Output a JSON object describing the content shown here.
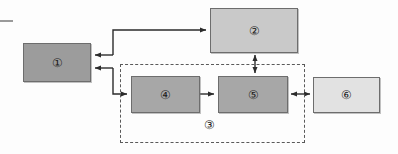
{
  "diagram": {
    "background_color": "#fdfdfd",
    "nodes": [
      {
        "id": "node-1",
        "label": "①",
        "number": 1,
        "x": 23,
        "y": 43,
        "w": 68,
        "h": 39,
        "fill": "#9c9c9c",
        "stroke": "#6d6d6d"
      },
      {
        "id": "node-2",
        "label": "②",
        "number": 2,
        "x": 210,
        "y": 8,
        "w": 88,
        "h": 45,
        "fill": "#c9c9c9",
        "stroke": "#6d6d6d"
      },
      {
        "id": "node-4",
        "label": "④",
        "number": 4,
        "x": 131,
        "y": 76,
        "w": 69,
        "h": 37,
        "fill": "#a7a7a7",
        "stroke": "#6d6d6d"
      },
      {
        "id": "node-5",
        "label": "⑤",
        "number": 5,
        "x": 218,
        "y": 76,
        "w": 70,
        "h": 37,
        "fill": "#a7a7a7",
        "stroke": "#6d6d6d"
      },
      {
        "id": "node-6",
        "label": "⑥",
        "number": 6,
        "x": 313,
        "y": 77,
        "w": 67,
        "h": 36,
        "fill": "#e2e2e2",
        "stroke": "#6d6d6d"
      }
    ],
    "group": {
      "id": "group-3",
      "label": "③",
      "number": 3,
      "x": 120,
      "y": 64,
      "w": 185,
      "h": 79,
      "stroke": "#5a5a5a",
      "style": "dashed",
      "label_x": 210,
      "label_y": 126
    },
    "connectors": [
      {
        "id": "conn-1-to-2",
        "from": "node-1",
        "to": "node-2",
        "arrow": "both-ends-separate",
        "direction": "bidirectional-routed"
      },
      {
        "id": "conn-4-to-5",
        "from": "node-4",
        "to": "node-5",
        "arrow": "single",
        "direction": "forward"
      },
      {
        "id": "conn-2-to-5",
        "from": "node-2",
        "to": "node-5",
        "arrow": "double",
        "direction": "bidirectional"
      },
      {
        "id": "conn-5-to-6",
        "from": "node-5",
        "to": "node-6",
        "arrow": "double",
        "direction": "bidirectional"
      },
      {
        "id": "conn-1-to-4",
        "from": "node-1",
        "to": "node-4",
        "arrow": "single",
        "direction": "forward"
      }
    ],
    "line_color": "#2b2b2b"
  }
}
